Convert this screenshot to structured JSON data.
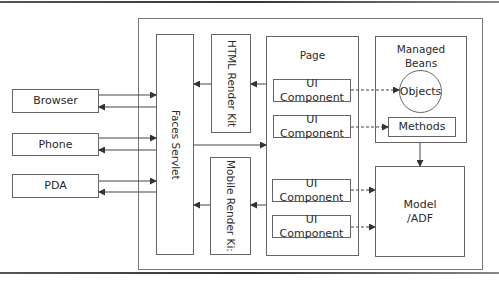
{
  "diagram": {
    "clients": [
      {
        "label": "Browser"
      },
      {
        "label": "Phone"
      },
      {
        "label": "PDA"
      }
    ],
    "faces_servlet": {
      "label": "Faces Servlet"
    },
    "render_kits": [
      {
        "label": "HTML Render Kit"
      },
      {
        "label": "Mobile Render Ki:"
      }
    ],
    "page": {
      "title": "Page",
      "components": [
        {
          "label": "UI Component"
        },
        {
          "label": "UI Component"
        },
        {
          "label": "UI Component"
        },
        {
          "label": "UI Component"
        }
      ]
    },
    "managed_beans": {
      "title_line1": "Managed",
      "title_line2": "Beans",
      "objects": {
        "label": "Objects"
      },
      "methods": {
        "label": "Methods"
      }
    },
    "model": {
      "line1": "Model",
      "line2": "/ADF"
    },
    "colors": {
      "line": "#555555",
      "border": "#666666",
      "text": "#2a2a2a"
    }
  }
}
